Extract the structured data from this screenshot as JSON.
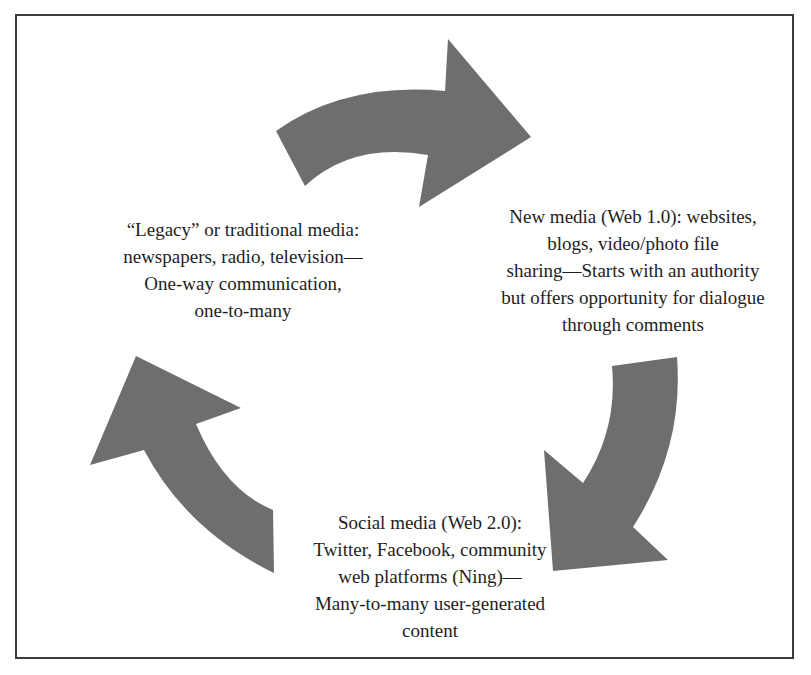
{
  "diagram": {
    "type": "cycle",
    "arrow_color": "#6e6e6e",
    "border_color": "#3c3c3c",
    "nodes": [
      {
        "id": "legacy",
        "lines": [
          "“Legacy” or traditional media:",
          "newspapers, radio, television—",
          "One-way communication,",
          "one-to-many"
        ]
      },
      {
        "id": "new-media",
        "lines": [
          "New media (Web 1.0): websites,",
          "blogs, video/photo file",
          "sharing—Starts with an authority",
          "but offers opportunity for dialogue",
          "through comments"
        ]
      },
      {
        "id": "social-media",
        "lines": [
          "Social media (Web 2.0):",
          "Twitter, Facebook, community",
          "web platforms (Ning)—",
          "Many-to-many user-generated",
          "content"
        ]
      }
    ],
    "arrows": [
      {
        "id": "arrow-legacy-to-new",
        "from": "legacy",
        "to": "new-media",
        "icon": "curved-arrow-right-icon"
      },
      {
        "id": "arrow-new-to-social",
        "from": "new-media",
        "to": "social-media",
        "icon": "curved-arrow-down-left-icon"
      },
      {
        "id": "arrow-social-to-legacy",
        "from": "social-media",
        "to": "legacy",
        "icon": "curved-arrow-up-left-icon"
      }
    ]
  }
}
